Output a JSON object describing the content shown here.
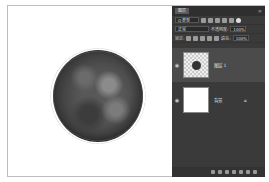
{
  "canvas": {
    "content": "tree-top-view",
    "background": "#ffffff"
  },
  "layers_panel": {
    "tab_label": "图层",
    "filter": {
      "icon": "search-icon",
      "value": "Q 类型"
    },
    "blend_mode": "正常",
    "opacity_label": "不透明度:",
    "opacity_value": "100%",
    "lock_label": "锁定:",
    "fill_label": "填充:",
    "fill_value": "100%",
    "layers": [
      {
        "name": "图层 1",
        "visible": true,
        "selected": true,
        "thumbnail": "tree-on-transparent"
      },
      {
        "name": "背景",
        "visible": true,
        "selected": false,
        "locked": true,
        "thumbnail": "white"
      }
    ],
    "footer_icons": [
      "link-icon",
      "fx-icon",
      "mask-icon",
      "adjustment-icon",
      "folder-icon",
      "new-layer-icon",
      "trash-icon"
    ]
  },
  "colors": {
    "panel_bg": "#3a3a3a",
    "selected_layer": "#4b4b4b",
    "text": "#cfcfcf"
  }
}
